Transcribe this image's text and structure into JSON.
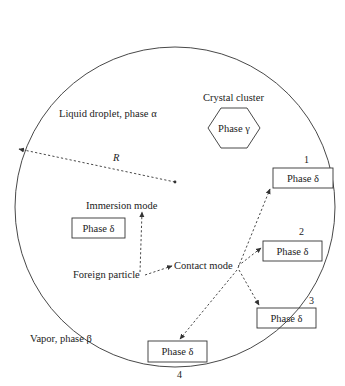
{
  "diagram": {
    "droplet_label": "Liquid droplet, phase α",
    "vapor_label": "Vapor, phase β",
    "radius_label": "R",
    "crystal_cluster_label": "Crystal cluster",
    "crystal_phase_label": "Phase γ",
    "immersion_label": "Immersion mode",
    "foreign_particle_label": "Foreign particle",
    "contact_mode_label": "Contact mode",
    "immersion_box_label": "Phase δ",
    "contact_boxes": [
      {
        "number": "1",
        "label": "Phase δ"
      },
      {
        "number": "2",
        "label": "Phase δ"
      },
      {
        "number": "3",
        "label": "Phase δ"
      },
      {
        "number": "4",
        "label": "Phase δ"
      }
    ],
    "colors": {
      "line": "#333333",
      "text": "#222222",
      "background": "#ffffff"
    }
  }
}
